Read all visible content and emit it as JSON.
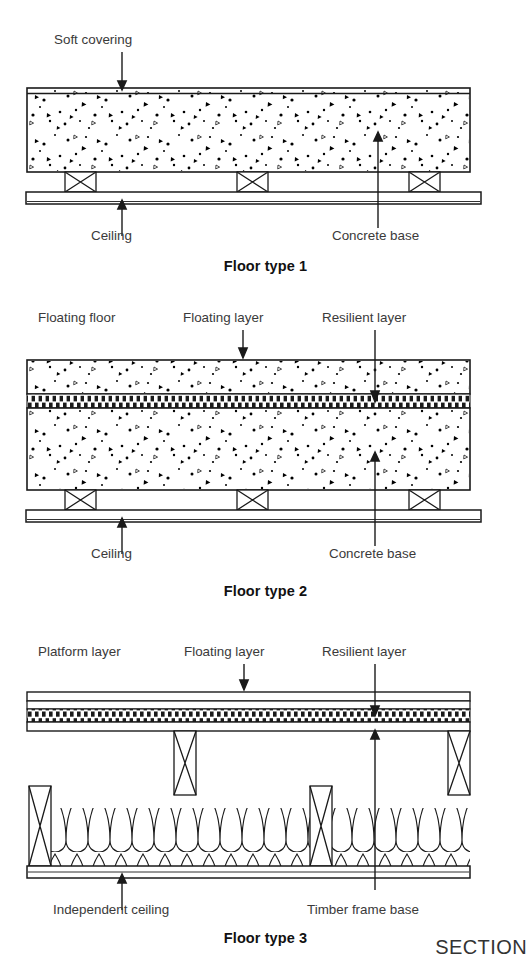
{
  "figure": {
    "view_label": "SECTION",
    "stroke_color": "#1a1a1a",
    "label_color": "#3a3a3a",
    "background": "#ffffff"
  },
  "diagrams": [
    {
      "id": "floor-type-1",
      "caption": "Floor type 1",
      "labels": {
        "top_left": "Soft covering",
        "bottom_left": "Ceiling",
        "bottom_right": "Concrete base"
      },
      "layers": [
        "Soft covering",
        "Concrete base",
        "Ceiling"
      ]
    },
    {
      "id": "floor-type-2",
      "caption": "Floor type 2",
      "labels": {
        "top_left": "Floating floor",
        "top_mid": "Floating layer",
        "top_right": "Resilient layer",
        "bottom_left": "Ceiling",
        "bottom_right": "Concrete base"
      },
      "layers": [
        "Floating layer",
        "Resilient layer",
        "Concrete base",
        "Ceiling"
      ]
    },
    {
      "id": "floor-type-3",
      "caption": "Floor type 3",
      "labels": {
        "top_left": "Platform layer",
        "top_mid": "Floating layer",
        "top_right": "Resilient layer",
        "bottom_left": "Independent ceiling",
        "bottom_right": "Timber frame base"
      },
      "layers": [
        "Platform layer",
        "Floating layer",
        "Resilient layer",
        "Timber frame base",
        "Independent ceiling"
      ]
    }
  ]
}
